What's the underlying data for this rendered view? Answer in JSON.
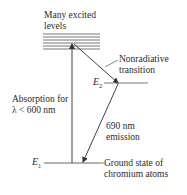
{
  "diagram": {
    "labels": {
      "excited_levels": [
        "Many excited",
        "levels"
      ],
      "nonradiative": [
        "Nonradiative",
        "transition"
      ],
      "absorption": [
        "Absorption for",
        "λ < 600 nm"
      ],
      "emission": [
        "690 nm",
        "emission"
      ],
      "ground_state": [
        "Ground state of",
        "chromium atoms"
      ]
    },
    "symbols": {
      "e2": "E",
      "e2_sub": "2",
      "e1": "E",
      "e1_sub": "1"
    },
    "colors": {
      "line": "#555555",
      "band": "#6e6e6e"
    }
  }
}
